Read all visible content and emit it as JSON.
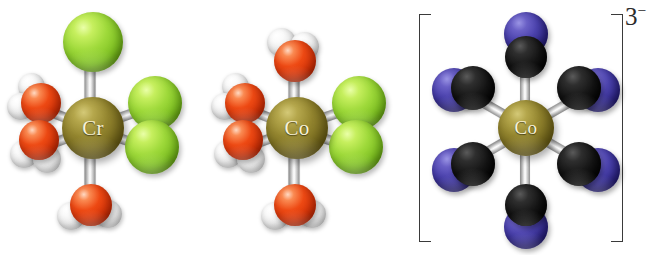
{
  "figure": {
    "kind": "molecular-structure-illustration",
    "background_color": "#ffffff",
    "width": 657,
    "height": 255
  },
  "palette": {
    "chlorine": "#9ed93a",
    "oxygen": "#ee4a14",
    "hydrogen": "#f2f2f2",
    "carbon": "#151515",
    "nitrogen": "#4b42ad",
    "metal": "#94862f",
    "bond": "#d8d8d8",
    "label_text": "#f7f2d8",
    "bracket": "#3a3a3a"
  },
  "complexes": [
    {
      "id": "complex-1",
      "metal_label": "Cr",
      "geometry": "octahedral",
      "charge": "",
      "bracketed": false,
      "ligands": [
        {
          "type": "chloride",
          "position": "top",
          "icon": "chlorine-atom"
        },
        {
          "type": "chloride",
          "position": "right-upper",
          "icon": "chlorine-atom"
        },
        {
          "type": "chloride",
          "position": "right-lower",
          "icon": "chlorine-atom"
        },
        {
          "type": "water",
          "position": "left-upper",
          "icon": "water-molecule"
        },
        {
          "type": "water",
          "position": "left-lower",
          "icon": "water-molecule"
        },
        {
          "type": "water",
          "position": "bottom",
          "icon": "water-molecule"
        }
      ],
      "ligand_counts": {
        "chloride": 3,
        "water": 3
      }
    },
    {
      "id": "complex-2",
      "metal_label": "Co",
      "geometry": "octahedral",
      "charge": "",
      "bracketed": false,
      "ligands": [
        {
          "type": "water",
          "position": "top",
          "icon": "water-molecule"
        },
        {
          "type": "chloride",
          "position": "right-upper",
          "icon": "chlorine-atom"
        },
        {
          "type": "chloride",
          "position": "right-lower",
          "icon": "chlorine-atom"
        },
        {
          "type": "water",
          "position": "left-upper",
          "icon": "water-molecule"
        },
        {
          "type": "water",
          "position": "left-lower",
          "icon": "water-molecule"
        },
        {
          "type": "water",
          "position": "bottom",
          "icon": "water-molecule"
        }
      ],
      "ligand_counts": {
        "chloride": 2,
        "water": 4
      }
    },
    {
      "id": "complex-3",
      "metal_label": "Co",
      "geometry": "octahedral",
      "charge": "3",
      "charge_sign": "−",
      "charge_text": "3−",
      "bracketed": true,
      "ligands": [
        {
          "type": "cyanide",
          "position": "top",
          "icon": "cyanide-ligand"
        },
        {
          "type": "cyanide",
          "position": "bottom",
          "icon": "cyanide-ligand"
        },
        {
          "type": "cyanide",
          "position": "upper-left",
          "icon": "cyanide-ligand"
        },
        {
          "type": "cyanide",
          "position": "upper-right",
          "icon": "cyanide-ligand"
        },
        {
          "type": "cyanide",
          "position": "lower-left",
          "icon": "cyanide-ligand"
        },
        {
          "type": "cyanide",
          "position": "lower-right",
          "icon": "cyanide-ligand"
        }
      ],
      "ligand_counts": {
        "cyanide": 6
      }
    }
  ]
}
